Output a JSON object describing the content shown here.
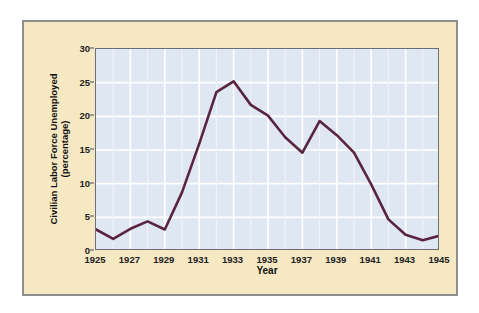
{
  "chart_data": {
    "type": "line",
    "title": "",
    "xlabel": "Year",
    "ylabel": "Civilian Labor Force Unemployed\n(percentage)",
    "xlim": [
      1925,
      1945
    ],
    "ylim": [
      0,
      30
    ],
    "yticks": [
      0,
      5,
      10,
      15,
      20,
      25,
      30
    ],
    "xticks": [
      1925,
      1927,
      1929,
      1931,
      1933,
      1935,
      1937,
      1939,
      1941,
      1943,
      1945
    ],
    "grid": true,
    "legend": "none",
    "line_color": "#5a2440",
    "plot_background": "#dfe7f2",
    "figure_background": "#f7e8c4",
    "x": [
      1925,
      1926,
      1927,
      1928,
      1929,
      1930,
      1931,
      1932,
      1933,
      1934,
      1935,
      1936,
      1937,
      1938,
      1939,
      1940,
      1941,
      1942,
      1943,
      1944,
      1945
    ],
    "values": [
      3.2,
      1.8,
      3.3,
      4.4,
      3.2,
      8.7,
      15.9,
      23.6,
      25.2,
      21.7,
      20.1,
      16.9,
      14.6,
      19.3,
      17.2,
      14.6,
      9.9,
      4.7,
      2.4,
      1.6,
      2.3
    ],
    "series": [
      {
        "name": "Civilian Labor Force Unemployed (percentage)",
        "values": [
          3.2,
          1.8,
          3.3,
          4.4,
          3.2,
          8.7,
          15.9,
          23.6,
          25.2,
          21.7,
          20.1,
          16.9,
          14.6,
          19.3,
          17.2,
          14.6,
          9.9,
          4.7,
          2.4,
          1.6,
          2.3
        ]
      }
    ]
  }
}
